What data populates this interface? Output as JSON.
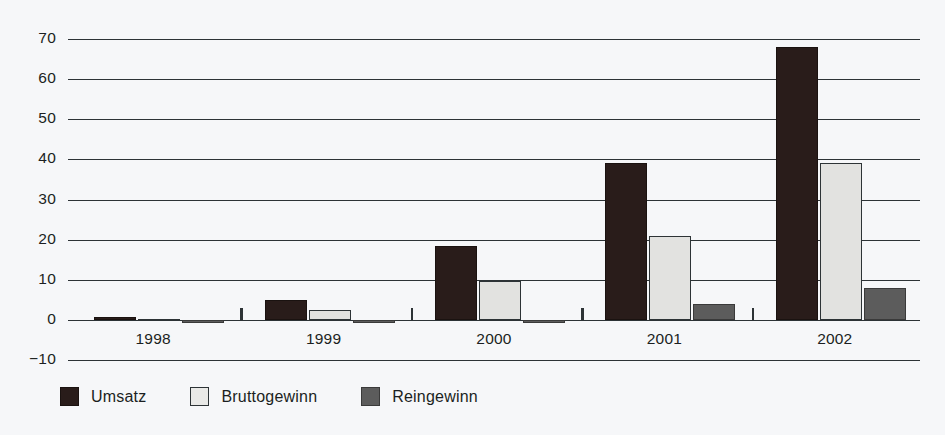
{
  "chart_data": {
    "type": "bar",
    "title": "",
    "subtitle": "",
    "xlabel": "",
    "ylabel": "",
    "categories": [
      "1998",
      "1999",
      "2000",
      "2001",
      "2002"
    ],
    "series": [
      {
        "name": "Umsatz",
        "color": "#291c1a",
        "values": [
          0.8,
          5.0,
          18.5,
          39.2,
          68.0
        ]
      },
      {
        "name": "Bruttogewinn",
        "color": "#e2e2e0",
        "values": [
          0.3,
          2.5,
          9.7,
          21.0,
          39.0
        ]
      },
      {
        "name": "Reingewinn",
        "color": "#5c5c5c",
        "values": [
          -0.8,
          -0.9,
          -0.7,
          4.0,
          8.0
        ]
      }
    ],
    "yticks": [
      70,
      60,
      50,
      40,
      30,
      20,
      10,
      0,
      -10
    ],
    "ytick_labels": [
      "70",
      "60",
      "50",
      "40",
      "30",
      "20",
      "10",
      "0",
      "−10"
    ],
    "ylim": [
      -10,
      70
    ],
    "grid": true,
    "grid_axis": "y",
    "legend_position": "bottom-left",
    "background_color": "#f6f7f9",
    "axis_color": "#2d3336"
  },
  "legend": {
    "items": [
      {
        "label": "Umsatz"
      },
      {
        "label": "Bruttogewinn"
      },
      {
        "label": "Reingewinn"
      }
    ]
  }
}
